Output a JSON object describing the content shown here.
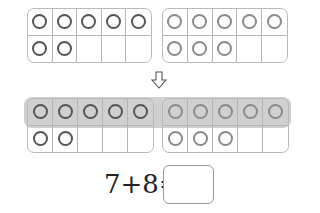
{
  "top_row": {
    "left_frame": {
      "counters": 7,
      "style": "dark"
    },
    "right_frame": {
      "counters": 8,
      "style": "light"
    }
  },
  "arrow": {
    "icon": "down-arrow-icon"
  },
  "bottom_row": {
    "left_frame": {
      "counters": 7,
      "style": "dark"
    },
    "right_frame": {
      "counters": 8,
      "style": "light"
    },
    "highlight": "first row of both frames (10 counters)",
    "highlight_color": "#a6a6a6"
  },
  "equation": {
    "text": "7+8=",
    "answer": ""
  },
  "colors": {
    "frame_border": "#b5b5b5",
    "dark_counter": "#555555",
    "light_counter": "#8a8a8a"
  }
}
